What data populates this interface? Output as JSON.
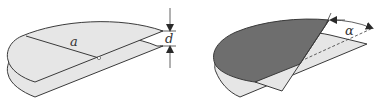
{
  "figure": {
    "panels": [
      {
        "id": "left",
        "description": "Two parallel half-disc plates separated by distance d",
        "labels": {
          "radius": "a",
          "separation": "d"
        }
      },
      {
        "id": "right",
        "description": "Top half-disc plate rotated by angle alpha relative to bottom plate",
        "labels": {
          "angle": "α"
        }
      }
    ],
    "colors": {
      "plate_light": "#e6e6e6",
      "plate_dark": "#6e6e6e",
      "outline": "#3a3a3a",
      "background": "#ffffff"
    }
  }
}
